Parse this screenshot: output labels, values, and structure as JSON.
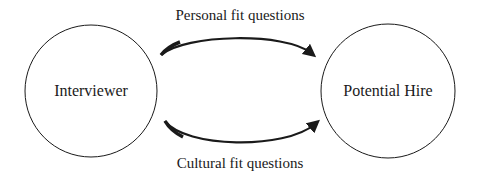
{
  "diagram": {
    "nodes": [
      {
        "id": "interviewer",
        "label": "Interviewer"
      },
      {
        "id": "potential_hire",
        "label": "Potential Hire"
      }
    ],
    "edges": [
      {
        "from": "interviewer",
        "to": "potential_hire",
        "label": "Personal fit questions"
      },
      {
        "from": "interviewer",
        "to": "potential_hire",
        "label": "Cultural fit questions"
      }
    ],
    "colors": {
      "stroke": "#1a1a1a",
      "background": "#ffffff"
    }
  }
}
